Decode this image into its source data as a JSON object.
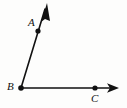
{
  "figure": {
    "type": "geometry-angle-diagram",
    "background_color": "#fdfdfc",
    "stroke_color": "#111111",
    "width": 127,
    "height": 108,
    "labels": [
      {
        "name": "A",
        "text": "A",
        "x": 28,
        "y": 17
      },
      {
        "name": "B",
        "text": "B",
        "x": 7,
        "y": 81
      },
      {
        "name": "C",
        "text": "C",
        "x": 91,
        "y": 93
      }
    ],
    "points": [
      {
        "name": "A",
        "cx": 38,
        "cy": 31,
        "r": 2.6
      },
      {
        "name": "B",
        "cx": 21,
        "cy": 88,
        "r": 2.8
      },
      {
        "name": "C",
        "cx": 95,
        "cy": 88,
        "r": 2.6
      }
    ],
    "rays": [
      {
        "name": "ray-BA",
        "from": "B",
        "through": "A",
        "x1": 21,
        "y1": 88,
        "x2": 45,
        "y2": 9,
        "arrow_tip_x": 47,
        "arrow_tip_y": 3,
        "stroke_width": 1.6
      },
      {
        "name": "ray-BC",
        "from": "B",
        "through": "C",
        "x1": 21,
        "y1": 88,
        "x2": 110,
        "y2": 88,
        "arrow_tip_x": 119,
        "arrow_tip_y": 88,
        "stroke_width": 1.6
      }
    ],
    "arrowheads": [
      {
        "name": "arrowhead-A",
        "points": "47,3 41,22 45,19 50,21"
      },
      {
        "name": "arrowhead-C",
        "points": "119,88 107,83 110,88 107,93"
      }
    ]
  }
}
